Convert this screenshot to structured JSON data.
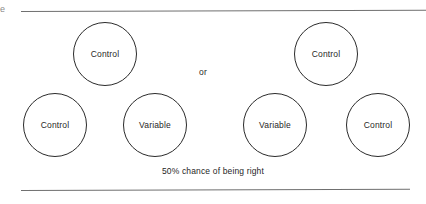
{
  "figure": {
    "edge_artifact": "e",
    "connector_label": "or",
    "caption": "50% chance of being right",
    "rules": {
      "top_present": true,
      "bottom_present": true,
      "color": "#6f6f6f"
    },
    "stroke_color": "#2b2b2b",
    "text_color": "#1f1f1f",
    "background_color": "#ffffff",
    "groups": [
      {
        "name": "left-group",
        "circles": [
          {
            "label": "Control",
            "position": "top"
          },
          {
            "label": "Control",
            "position": "bottom-left"
          },
          {
            "label": "Variable",
            "position": "bottom-right"
          }
        ]
      },
      {
        "name": "right-group",
        "circles": [
          {
            "label": "Control",
            "position": "top"
          },
          {
            "label": "Variable",
            "position": "bottom-left"
          },
          {
            "label": "Control",
            "position": "bottom-right"
          }
        ]
      }
    ]
  }
}
